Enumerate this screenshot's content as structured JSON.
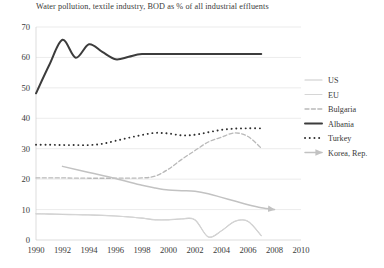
{
  "chart_data": {
    "type": "line",
    "title": "Water pollution, textile industry, BOD as % of all industrial effluents",
    "xlabel": "",
    "ylabel": "",
    "xlim": [
      1990,
      2010
    ],
    "ylim": [
      0,
      70
    ],
    "grid": true,
    "legend_position": "right",
    "xticks": [
      "1990",
      "1992",
      "1994",
      "1996",
      "1998",
      "2000",
      "2002",
      "2004",
      "2006",
      "2008",
      "2010"
    ],
    "yticks": [
      "0",
      "10",
      "20",
      "30",
      "40",
      "50",
      "60",
      "70"
    ],
    "series": [
      {
        "name": "US",
        "style": "solid-thin",
        "color": "#c9c9c9",
        "x": [
          1990,
          1991,
          1992,
          1993,
          1994,
          1995,
          1996,
          1997,
          1998,
          1999,
          2000,
          2001,
          2002,
          2003,
          2004,
          2005,
          2006,
          2007
        ],
        "values": [
          8.6,
          8.5,
          8.4,
          8.3,
          8.2,
          8.1,
          7.9,
          7.6,
          7.2,
          6.6,
          6.6,
          6.9,
          6.6,
          1.0,
          3.0,
          6.1,
          6.1,
          1.4
        ]
      },
      {
        "name": "EU",
        "style": "solid-thin-light",
        "color": "#d6d6d6",
        "x": [
          1990,
          1991,
          1992,
          1993,
          1994,
          1995,
          1996,
          1997,
          1998,
          1999,
          2000,
          2001,
          2002,
          2003,
          2004,
          2005,
          2006,
          2007
        ],
        "values": [
          8.7,
          8.6,
          8.5,
          8.4,
          8.3,
          8.1,
          7.9,
          7.6,
          7.2,
          6.7,
          6.7,
          7.0,
          6.7,
          1.1,
          3.1,
          6.2,
          6.2,
          1.5
        ]
      },
      {
        "name": "Bulgaria",
        "style": "dashed",
        "color": "#b9b9b9",
        "x": [
          1990,
          1992,
          1994,
          1996,
          1998,
          1999,
          2000,
          2001,
          2002,
          2003,
          2004,
          2005,
          2006,
          2007
        ],
        "values": [
          20.4,
          20.4,
          20.3,
          20.3,
          20.4,
          21.0,
          23.3,
          26.5,
          29.4,
          32.2,
          33.8,
          35.2,
          34.0,
          30.2
        ]
      },
      {
        "name": "Albania",
        "style": "solid-thick",
        "color": "#3c3c3c",
        "x": [
          1990,
          1991,
          1992,
          1993,
          1994,
          1995,
          1996,
          1997,
          1998,
          2000,
          2002,
          2004,
          2006,
          2007
        ],
        "values": [
          48.2,
          57.5,
          65.8,
          59.9,
          64.3,
          61.8,
          59.4,
          60.2,
          61.1,
          61.1,
          61.1,
          61.1,
          61.1,
          61.1
        ]
      },
      {
        "name": "Turkey",
        "style": "dotted",
        "color": "#2f2f2f",
        "x": [
          1990,
          1991,
          1992,
          1993,
          1994,
          1995,
          1996,
          1997,
          1998,
          1999,
          2000,
          2001,
          2002,
          2003,
          2004,
          2005,
          2006,
          2007
        ],
        "values": [
          31.3,
          31.3,
          31.2,
          31.2,
          31.2,
          31.6,
          32.6,
          33.6,
          34.5,
          35.2,
          35.0,
          34.4,
          34.6,
          35.4,
          36.2,
          36.6,
          36.7,
          36.7
        ]
      },
      {
        "name": "Korea, Rep.",
        "style": "solid-arrow",
        "color": "#c2c2c2",
        "x": [
          1992,
          1994,
          1996,
          1998,
          1999,
          2000,
          2001,
          2002,
          2003,
          2004,
          2005,
          2006,
          2007,
          2008
        ],
        "values": [
          24.2,
          22.2,
          20.2,
          18.0,
          17.1,
          16.4,
          16.2,
          16.0,
          15.2,
          14.0,
          12.8,
          11.6,
          10.6,
          10.0
        ]
      }
    ]
  },
  "legend": {
    "items": [
      {
        "label": "US",
        "icon": "line-solid-thin-icon"
      },
      {
        "label": "EU",
        "icon": "line-solid-thin-light-icon"
      },
      {
        "label": "Bulgaria",
        "icon": "line-dashed-icon"
      },
      {
        "label": "Albania",
        "icon": "line-solid-thick-icon"
      },
      {
        "label": "Turkey",
        "icon": "line-dotted-icon"
      },
      {
        "label": "Korea, Rep.",
        "icon": "line-arrow-icon"
      }
    ]
  }
}
